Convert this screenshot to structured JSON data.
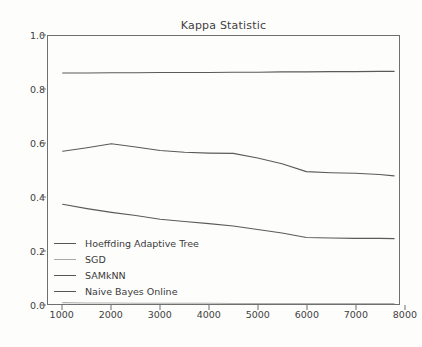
{
  "chart_data": {
    "type": "line",
    "title": "Kappa Statistic",
    "xlabel": "",
    "ylabel": "",
    "xlim": [
      700,
      7900
    ],
    "ylim": [
      0.0,
      1.0
    ],
    "grid": false,
    "legend_position": "lower left",
    "xticks": [
      1000,
      2000,
      3000,
      4000,
      5000,
      6000,
      7000,
      8000
    ],
    "xtick_labels": [
      "1000",
      "2000",
      "3000",
      "4000",
      "5000",
      "6000",
      "7000",
      "8000"
    ],
    "yticks": [
      0.0,
      0.2,
      0.4,
      0.6,
      0.8,
      1.0
    ],
    "ytick_labels": [
      "0.0",
      "0.2",
      "0.4",
      "0.6",
      "0.8",
      "1.0"
    ],
    "x": [
      1000,
      1500,
      2000,
      2500,
      3000,
      3500,
      4000,
      4500,
      5000,
      5500,
      6000,
      6500,
      7000,
      7500,
      7800
    ],
    "series": [
      {
        "name": "Hoeffding Adaptive Tree",
        "color": "#5a5a5a",
        "values": [
          0.862,
          0.862,
          0.863,
          0.863,
          0.864,
          0.864,
          0.864,
          0.865,
          0.865,
          0.866,
          0.866,
          0.867,
          0.867,
          0.868,
          0.868
        ]
      },
      {
        "name": "SGD",
        "color": "#b0b0b0",
        "values": [
          0.005,
          0.004,
          0.004,
          0.003,
          0.003,
          0.003,
          0.003,
          0.002,
          0.002,
          0.002,
          0.002,
          0.002,
          0.002,
          0.002,
          0.002
        ]
      },
      {
        "name": "SAMkNN",
        "color": "#5a5a5a",
        "values": [
          0.57,
          0.583,
          0.598,
          0.586,
          0.573,
          0.566,
          0.563,
          0.562,
          0.545,
          0.523,
          0.494,
          0.49,
          0.488,
          0.483,
          0.478
        ]
      },
      {
        "name": "Naive Bayes Online",
        "color": "#5a5a5a",
        "values": [
          0.372,
          0.356,
          0.342,
          0.33,
          0.316,
          0.308,
          0.3,
          0.291,
          0.278,
          0.265,
          0.248,
          0.246,
          0.245,
          0.245,
          0.244
        ]
      }
    ]
  },
  "legend": {
    "items": [
      {
        "label": "Hoeffding Adaptive Tree",
        "style": "dark"
      },
      {
        "label": "SGD",
        "style": "light"
      },
      {
        "label": "SAMkNN",
        "style": "dark"
      },
      {
        "label": "Naive Bayes Online",
        "style": "dark"
      }
    ]
  },
  "colors": {
    "axis": "#6f6f6f",
    "text": "#3a3a3a",
    "background": "#fdfdfc"
  }
}
